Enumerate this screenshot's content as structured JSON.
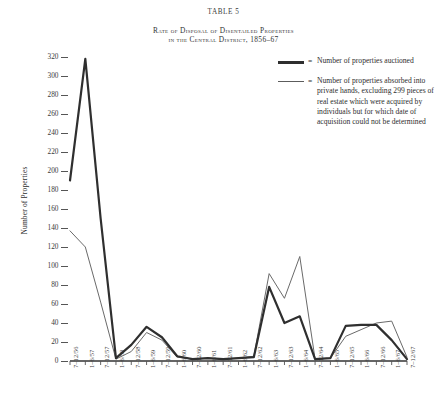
{
  "header": {
    "table_number": "TABLE 5",
    "title_line1": "Rate of Disposal of Disentailed Properties",
    "title_line2": "in the Central District, 1856–67"
  },
  "legend": {
    "eq": "=",
    "entries": [
      {
        "style": "thick",
        "label": "Number of properties auctioned"
      },
      {
        "style": "thin",
        "label": "Number of properties absorbed into private hands, excluding 299 pieces of real estate which were acquired by individuals but for which date of acquisition could not be determined"
      }
    ]
  },
  "chart_data": {
    "type": "line",
    "title": "Rate of Disposal of Disentailed Properties in the Central District, 1856–67",
    "xlabel": "",
    "ylabel": "Number of Properties",
    "ylim": [
      0,
      330
    ],
    "yticks": [
      0,
      20,
      40,
      60,
      80,
      100,
      120,
      140,
      160,
      180,
      200,
      220,
      240,
      260,
      280,
      300,
      320
    ],
    "grid": false,
    "legend_position": "top-right",
    "categories": [
      "7–12/56",
      "1–6/57",
      "7–12/57",
      "1–6/58",
      "7–12/58",
      "1–6/59",
      "7–12/59",
      "1–6/60",
      "7–12/60",
      "1–6/61",
      "7–12/61",
      "1–6/62",
      "7–12/62",
      "1–6/63",
      "7–12/63",
      "1–6/64",
      "7–12/64",
      "1–6/65",
      "7–12/65",
      "1–6/66",
      "7–12/66",
      "1–6/67",
      "7–12/67"
    ],
    "series": [
      {
        "name": "Number of properties auctioned",
        "style": "thick",
        "values": [
          190,
          318,
          150,
          3,
          17,
          36,
          25,
          5,
          2,
          3,
          2,
          3,
          4,
          78,
          40,
          47,
          2,
          3,
          37,
          38,
          38,
          22,
          2
        ]
      },
      {
        "name": "Number of properties absorbed into private hands",
        "style": "thin",
        "values": [
          137,
          120,
          62,
          2,
          10,
          30,
          22,
          4,
          2,
          3,
          2,
          3,
          5,
          92,
          66,
          110,
          2,
          3,
          26,
          33,
          40,
          42,
          4
        ]
      }
    ]
  }
}
